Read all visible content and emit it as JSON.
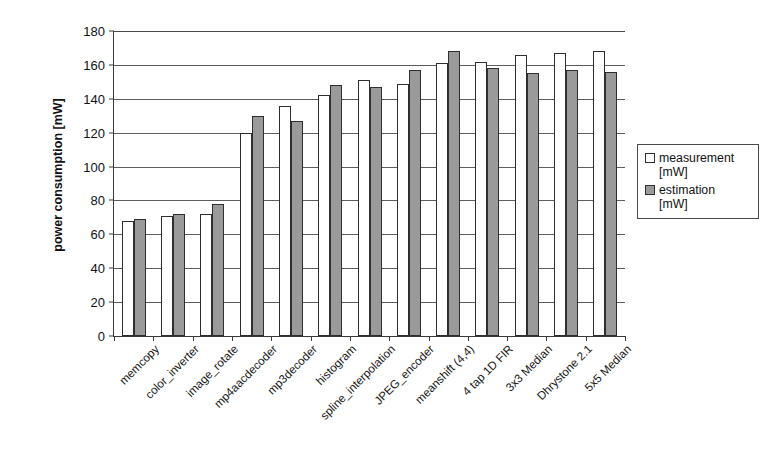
{
  "chart_data": {
    "type": "bar",
    "title": "",
    "xlabel": "",
    "ylabel": "power consumption [mW]",
    "ylim": [
      0,
      180
    ],
    "yticks": [
      0,
      20,
      40,
      60,
      80,
      100,
      120,
      140,
      160,
      180
    ],
    "grid": true,
    "legend_position": "right",
    "categories": [
      "memcopy",
      "color_inverter",
      "image_rotate",
      "mp4aacdecoder",
      "mp3decoder",
      "histogram",
      "spline_interpolation",
      "JPEG_encoder",
      "meanshift (4,4)",
      "4 tap 1D FIR",
      "3x3 Median",
      "Dhrystone 2.1",
      "5x5 Median"
    ],
    "series": [
      {
        "name": "measurement [mW]",
        "color": "#ffffff",
        "values": [
          68,
          71,
          72,
          120,
          136,
          142,
          151,
          149,
          161,
          162,
          166,
          167,
          168
        ]
      },
      {
        "name": "estimation [mW]",
        "color": "#9a9a9a",
        "values": [
          69,
          72,
          78,
          130,
          127,
          148,
          147,
          157,
          168,
          158,
          155,
          157,
          156
        ]
      }
    ]
  },
  "legend": {
    "items": [
      {
        "label": "measurement",
        "unit": "[mW]",
        "swatch": "measurement"
      },
      {
        "label": "estimation",
        "unit": "[mW]",
        "swatch": "estimation"
      }
    ]
  },
  "axis": {
    "y_title": "power consumption [mW]"
  }
}
